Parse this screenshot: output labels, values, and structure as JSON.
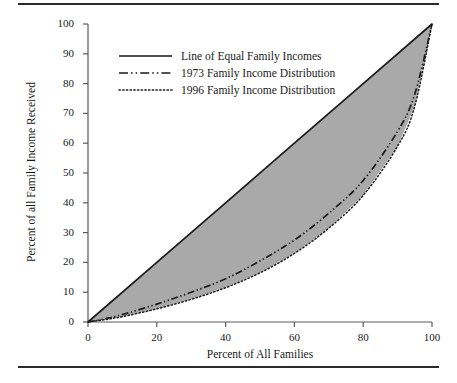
{
  "chart_data": {
    "type": "line",
    "title": "",
    "xlabel": "Percent of All Families",
    "ylabel": "Percent of all Family Income Received",
    "xlim": [
      0,
      100
    ],
    "ylim": [
      0,
      100
    ],
    "xticks": [
      0,
      20,
      40,
      60,
      80,
      100
    ],
    "yticks": [
      0,
      10,
      20,
      30,
      40,
      50,
      60,
      70,
      80,
      90,
      100
    ],
    "grid": false,
    "legend_position": "upper-left-inside",
    "shaded_region": {
      "label": "area between line of equality and 1996 distribution",
      "color": "#a9a9a9",
      "between": [
        "equality",
        "dist_1996"
      ]
    },
    "series": [
      {
        "name": "Line of Equal Family Incomes",
        "key": "equality",
        "style": "solid",
        "color": "#1a1a1a",
        "x": [
          0,
          20,
          40,
          60,
          80,
          100
        ],
        "y": [
          0,
          20,
          40,
          60,
          80,
          100
        ]
      },
      {
        "name": "1973 Family Income Distribution",
        "key": "dist_1973",
        "style": "dash-dot-dot",
        "color": "#1a1a1a",
        "x": [
          0,
          5,
          10,
          20,
          30,
          40,
          50,
          60,
          70,
          80,
          90,
          95,
          100
        ],
        "y": [
          0,
          1.1,
          2.5,
          6.0,
          10.0,
          14.5,
          20.5,
          27.5,
          36.5,
          47.5,
          64.0,
          76.5,
          100
        ]
      },
      {
        "name": "1996 Family Income Distribution",
        "key": "dist_1996",
        "style": "dotted",
        "color": "#1a1a1a",
        "x": [
          0,
          5,
          10,
          20,
          30,
          40,
          50,
          60,
          70,
          80,
          90,
          95,
          100
        ],
        "y": [
          0,
          0.8,
          1.8,
          4.4,
          7.6,
          11.5,
          16.5,
          23.0,
          31.5,
          42.5,
          59.0,
          72.5,
          100
        ]
      }
    ]
  },
  "axes": {
    "x_title": "Percent of All Families",
    "y_title": "Percent of all Family Income Received",
    "x_tick_labels": [
      "0",
      "20",
      "40",
      "60",
      "80",
      "100"
    ],
    "y_tick_labels": [
      "0",
      "10",
      "20",
      "30",
      "40",
      "50",
      "60",
      "70",
      "80",
      "90",
      "100"
    ]
  },
  "legend": {
    "items": [
      {
        "label": "Line of Equal Family Incomes",
        "style": "solid"
      },
      {
        "label": "1973 Family Income Distribution",
        "style": "dash-dot-dot"
      },
      {
        "label": "1996 Family Income Distribution",
        "style": "dotted"
      }
    ]
  },
  "colors": {
    "ink": "#1a1a1a",
    "shade": "#a9a9a9",
    "rule": "#2b2b2b"
  }
}
